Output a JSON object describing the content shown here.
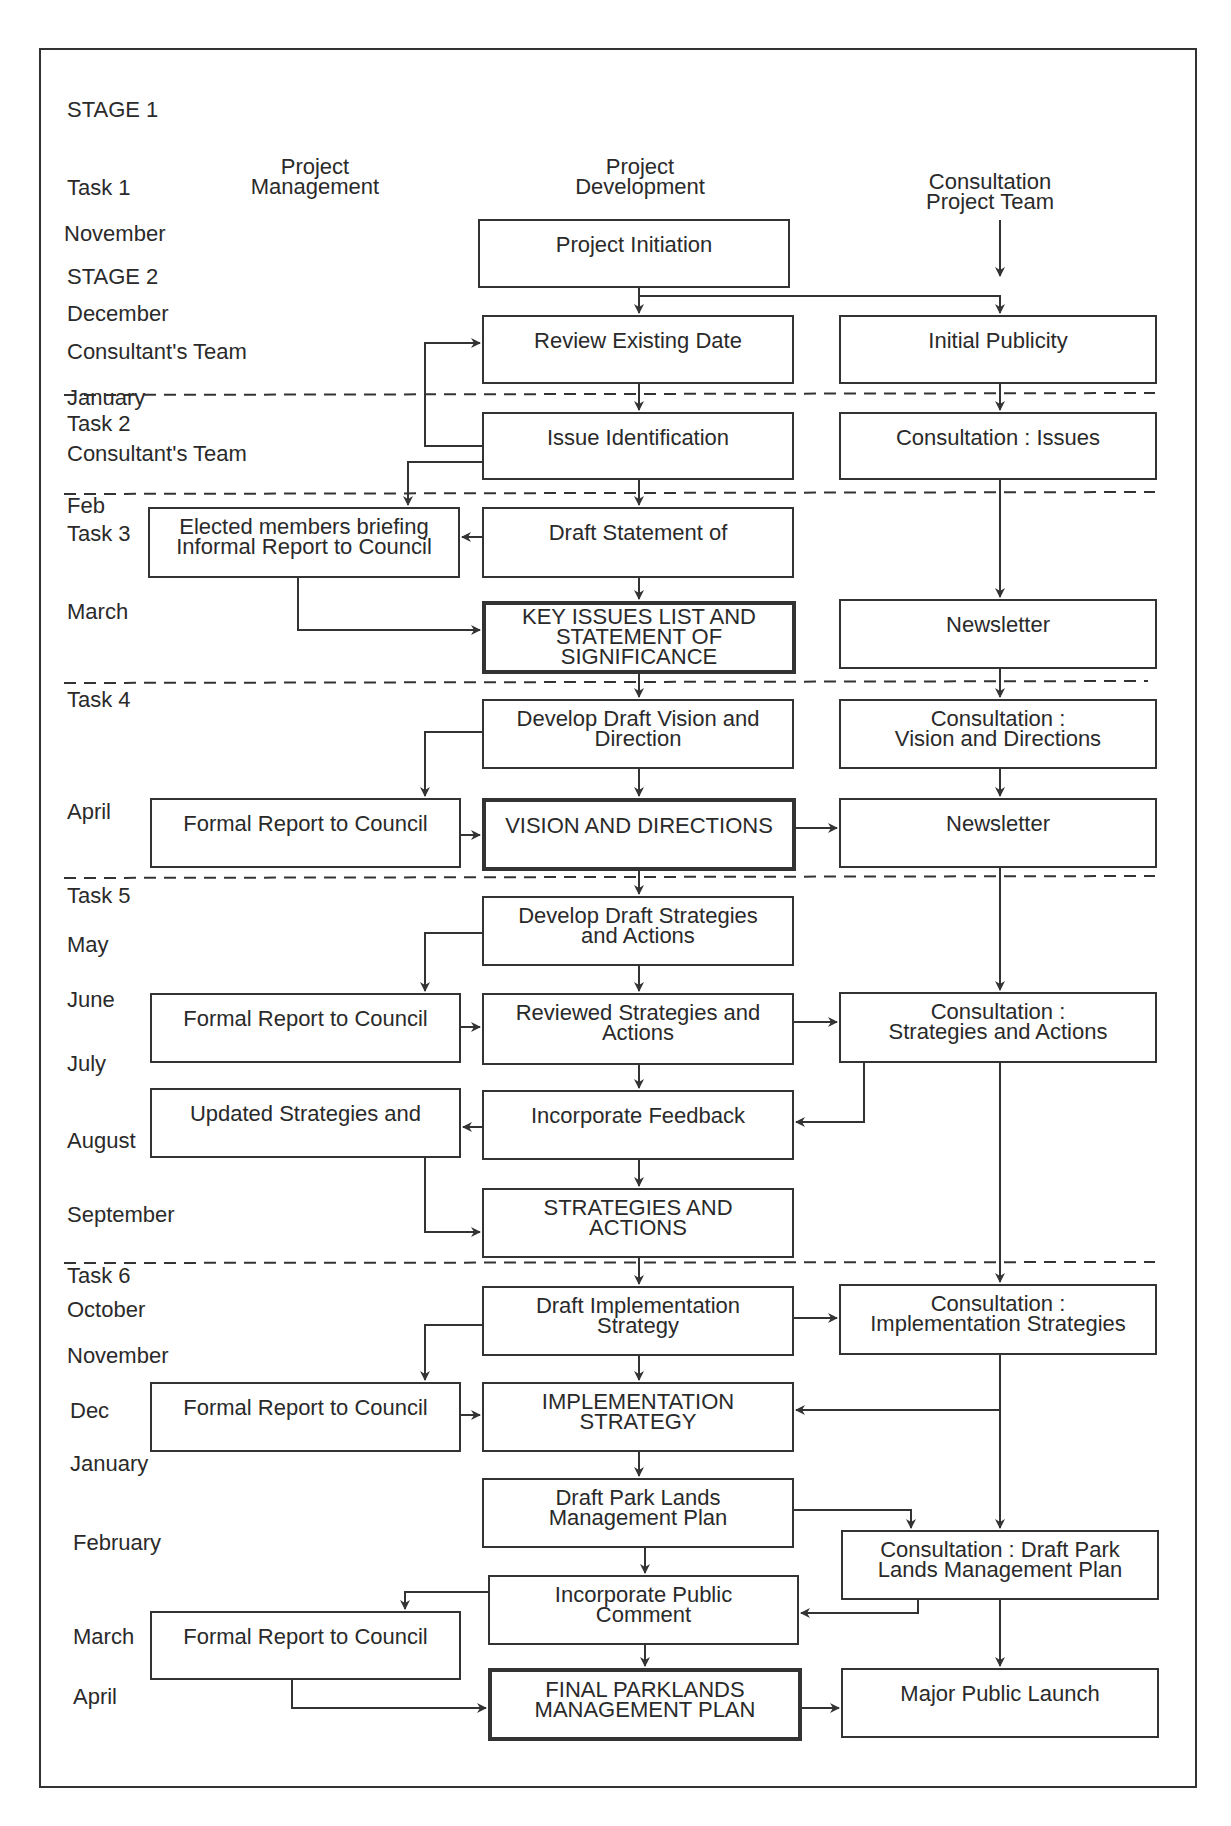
{
  "column_headers": {
    "management": "Project\nManagement",
    "development": "Project\nDevelopment",
    "consultation": "Consultation\nProject Team"
  },
  "row_labels": [
    {
      "text": "STAGE 1",
      "x": 67,
      "y": 110
    },
    {
      "text": "Task 1",
      "x": 67,
      "y": 188
    },
    {
      "text": "November",
      "x": 64,
      "y": 234
    },
    {
      "text": "STAGE 2",
      "x": 67,
      "y": 277
    },
    {
      "text": "December",
      "x": 67,
      "y": 314
    },
    {
      "text": "Consultant's Team",
      "x": 67,
      "y": 352
    },
    {
      "text": "January",
      "x": 67,
      "y": 398
    },
    {
      "text": "Task 2",
      "x": 67,
      "y": 424
    },
    {
      "text": "Consultant's Team",
      "x": 67,
      "y": 454
    },
    {
      "text": "Feb",
      "x": 67,
      "y": 506
    },
    {
      "text": "Task 3",
      "x": 67,
      "y": 534
    },
    {
      "text": "March",
      "x": 67,
      "y": 612
    },
    {
      "text": "Task 4",
      "x": 67,
      "y": 700
    },
    {
      "text": "April",
      "x": 67,
      "y": 812
    },
    {
      "text": "Task 5",
      "x": 67,
      "y": 896
    },
    {
      "text": "May",
      "x": 67,
      "y": 945
    },
    {
      "text": "June",
      "x": 67,
      "y": 1000
    },
    {
      "text": "July",
      "x": 67,
      "y": 1064
    },
    {
      "text": "August",
      "x": 67,
      "y": 1141
    },
    {
      "text": "September",
      "x": 67,
      "y": 1215
    },
    {
      "text": "Task 6",
      "x": 67,
      "y": 1276
    },
    {
      "text": "October",
      "x": 67,
      "y": 1310
    },
    {
      "text": "November",
      "x": 67,
      "y": 1356
    },
    {
      "text": "Dec",
      "x": 70,
      "y": 1411
    },
    {
      "text": "January",
      "x": 70,
      "y": 1464
    },
    {
      "text": "February",
      "x": 73,
      "y": 1543
    },
    {
      "text": "March",
      "x": 73,
      "y": 1637
    },
    {
      "text": "April",
      "x": 73,
      "y": 1697
    }
  ],
  "boxes": [
    {
      "id": "project-initiation",
      "text": "Project Initiation",
      "x": 478,
      "y": 219,
      "w": 312,
      "h": 69,
      "bold": false
    },
    {
      "id": "review-existing-date",
      "text": "Review Existing Date",
      "x": 482,
      "y": 315,
      "w": 312,
      "h": 69,
      "bold": false
    },
    {
      "id": "initial-publicity",
      "text": "Initial Publicity",
      "x": 839,
      "y": 315,
      "w": 318,
      "h": 69,
      "bold": false
    },
    {
      "id": "issue-identification",
      "text": "Issue Identification",
      "x": 482,
      "y": 412,
      "w": 312,
      "h": 68,
      "bold": false
    },
    {
      "id": "consultation-issues",
      "text": "Consultation : Issues",
      "x": 839,
      "y": 412,
      "w": 318,
      "h": 68,
      "bold": false
    },
    {
      "id": "elected-members-briefing",
      "text": "Elected members briefing\nInformal Report to Council",
      "x": 148,
      "y": 507,
      "w": 312,
      "h": 71,
      "bold": false
    },
    {
      "id": "draft-statement",
      "text": "Draft Statement of",
      "x": 482,
      "y": 507,
      "w": 312,
      "h": 71,
      "bold": false
    },
    {
      "id": "key-issues-list",
      "text": "KEY ISSUES LIST AND\nSTATEMENT OF\nSIGNIFICANCE",
      "x": 482,
      "y": 601,
      "w": 314,
      "h": 73,
      "bold": true
    },
    {
      "id": "newsletter-1",
      "text": "Newsletter",
      "x": 839,
      "y": 599,
      "w": 318,
      "h": 70,
      "bold": false
    },
    {
      "id": "develop-draft-vision",
      "text": "Develop Draft Vision and\nDirection",
      "x": 482,
      "y": 699,
      "w": 312,
      "h": 70,
      "bold": false
    },
    {
      "id": "consultation-vision",
      "text": "Consultation :\nVision and Directions",
      "x": 839,
      "y": 699,
      "w": 318,
      "h": 70,
      "bold": false
    },
    {
      "id": "formal-report-1",
      "text": "Formal Report to Council",
      "x": 150,
      "y": 798,
      "w": 311,
      "h": 70,
      "bold": false
    },
    {
      "id": "vision-and-directions",
      "text": "VISION AND DIRECTIONS",
      "x": 482,
      "y": 798,
      "w": 314,
      "h": 73,
      "bold": true
    },
    {
      "id": "newsletter-2",
      "text": "Newsletter",
      "x": 839,
      "y": 798,
      "w": 318,
      "h": 70,
      "bold": false
    },
    {
      "id": "develop-draft-strategies",
      "text": "Develop Draft Strategies\nand Actions",
      "x": 482,
      "y": 896,
      "w": 312,
      "h": 70,
      "bold": false
    },
    {
      "id": "formal-report-2",
      "text": "Formal Report to Council",
      "x": 150,
      "y": 993,
      "w": 311,
      "h": 70,
      "bold": false
    },
    {
      "id": "reviewed-strategies",
      "text": "Reviewed Strategies and\nActions",
      "x": 482,
      "y": 993,
      "w": 312,
      "h": 72,
      "bold": false
    },
    {
      "id": "consultation-strategies",
      "text": "Consultation :\nStrategies and Actions",
      "x": 839,
      "y": 992,
      "w": 318,
      "h": 71,
      "bold": false
    },
    {
      "id": "updated-strategies",
      "text": "Updated Strategies and",
      "x": 150,
      "y": 1088,
      "w": 311,
      "h": 70,
      "bold": false
    },
    {
      "id": "incorporate-feedback",
      "text": "Incorporate Feedback",
      "x": 482,
      "y": 1090,
      "w": 312,
      "h": 70,
      "bold": false
    },
    {
      "id": "strategies-and-actions",
      "text": "STRATEGIES AND\nACTIONS",
      "x": 482,
      "y": 1188,
      "w": 312,
      "h": 70,
      "bold": false
    },
    {
      "id": "draft-implementation",
      "text": "Draft Implementation\nStrategy",
      "x": 482,
      "y": 1286,
      "w": 312,
      "h": 70,
      "bold": false
    },
    {
      "id": "consultation-implementation",
      "text": "Consultation :\nImplementation Strategies",
      "x": 839,
      "y": 1284,
      "w": 318,
      "h": 71,
      "bold": false
    },
    {
      "id": "formal-report-3",
      "text": "Formal Report to Council",
      "x": 150,
      "y": 1382,
      "w": 311,
      "h": 70,
      "bold": false
    },
    {
      "id": "implementation-strategy",
      "text": "IMPLEMENTATION\nSTRATEGY",
      "x": 482,
      "y": 1382,
      "w": 312,
      "h": 70,
      "bold": false
    },
    {
      "id": "draft-park-lands",
      "text": "Draft Park Lands\nManagement Plan",
      "x": 482,
      "y": 1478,
      "w": 312,
      "h": 70,
      "bold": false
    },
    {
      "id": "consultation-draft-park",
      "text": "Consultation : Draft Park\nLands Management Plan",
      "x": 841,
      "y": 1530,
      "w": 318,
      "h": 70,
      "bold": false
    },
    {
      "id": "incorporate-public-comment",
      "text": "Incorporate Public\nComment",
      "x": 488,
      "y": 1575,
      "w": 311,
      "h": 70,
      "bold": false
    },
    {
      "id": "formal-report-4",
      "text": "Formal Report to Council",
      "x": 150,
      "y": 1611,
      "w": 311,
      "h": 69,
      "bold": false
    },
    {
      "id": "final-parklands-plan",
      "text": "FINAL PARKLANDS\nMANAGEMENT PLAN",
      "x": 488,
      "y": 1668,
      "w": 314,
      "h": 73,
      "bold": true
    },
    {
      "id": "major-public-launch",
      "text": "Major Public Launch",
      "x": 841,
      "y": 1668,
      "w": 318,
      "h": 70,
      "bold": false
    }
  ]
}
